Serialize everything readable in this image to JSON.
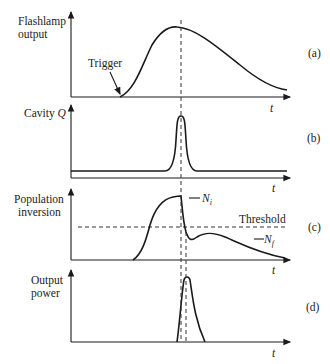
{
  "figure": {
    "panels": [
      {
        "id": "a",
        "tag": "(a)",
        "ylabel_lines": [
          "Flashlamp",
          "output"
        ],
        "xlabel": "t",
        "annotation": "Trigger"
      },
      {
        "id": "b",
        "tag": "(b)",
        "ylabel_lines": [
          "Cavity Q"
        ],
        "ylabel_main": "Cavity ",
        "ylabel_italic": "Q",
        "xlabel": "t"
      },
      {
        "id": "c",
        "tag": "(c)",
        "ylabel_lines": [
          "Population",
          "inversion"
        ],
        "xlabel": "t",
        "threshold_label": "Threshold",
        "ni_label": "N",
        "ni_sub": "i",
        "nf_label": "N",
        "nf_sub": "f"
      },
      {
        "id": "d",
        "tag": "(d)",
        "ylabel_lines": [
          "Output",
          "power"
        ],
        "xlabel": "t"
      }
    ]
  }
}
